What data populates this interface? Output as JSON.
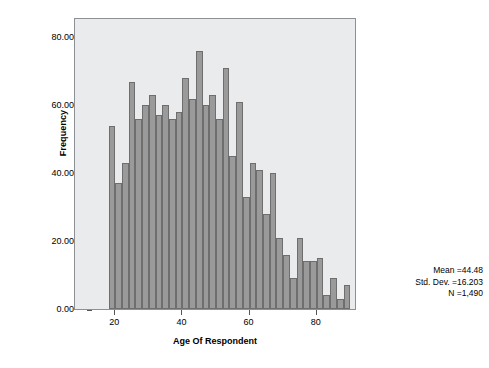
{
  "chart_data": {
    "type": "bar",
    "title": "",
    "subtitle": "",
    "xlabel": "Age Of Respondent",
    "ylabel": "Frequency",
    "xlim": [
      8,
      92
    ],
    "ylim": [
      0,
      86
    ],
    "grid": false,
    "legend": null,
    "bin_width": 2,
    "x_ticks": [
      {
        "value": 20,
        "label": "20"
      },
      {
        "value": 40,
        "label": "40"
      },
      {
        "value": 60,
        "label": "60"
      },
      {
        "value": 80,
        "label": "80"
      }
    ],
    "y_ticks": [
      {
        "value": 0,
        "label": "0.00"
      },
      {
        "value": 20,
        "label": "20.00"
      },
      {
        "value": 40,
        "label": "40.00"
      },
      {
        "value": 60,
        "label": "60.00"
      },
      {
        "value": 80,
        "label": "80.00"
      }
    ],
    "bin_centers": [
      19,
      21,
      23,
      25,
      27,
      29,
      31,
      33,
      35,
      37,
      39,
      41,
      43,
      45,
      47,
      49,
      51,
      53,
      55,
      57,
      59,
      61,
      63,
      65,
      67,
      69,
      71,
      73,
      75,
      77,
      79,
      81,
      83,
      85,
      87,
      89
    ],
    "values": [
      54,
      37,
      43,
      67,
      56,
      60,
      63,
      57,
      60,
      56,
      58,
      68,
      62,
      76,
      60,
      63,
      56,
      71,
      45,
      61,
      33,
      43,
      41,
      28,
      40,
      21,
      16,
      9,
      21,
      14,
      14,
      15,
      4,
      9,
      3,
      7
    ],
    "annotations": {
      "mean_label": "Mean =44.48",
      "std_dev_label": "Std. Dev. =16.203",
      "n_label": "N =1,490",
      "mean": 44.48,
      "std_dev": 16.203,
      "n": 1490
    }
  },
  "colors": {
    "bar_fill": "#9a9a9a",
    "bar_border": "#6e6e6e",
    "plot_background": "#e9ebec",
    "plot_border": "#8d9094",
    "page_background": "#ffffff",
    "text": "#000000"
  }
}
